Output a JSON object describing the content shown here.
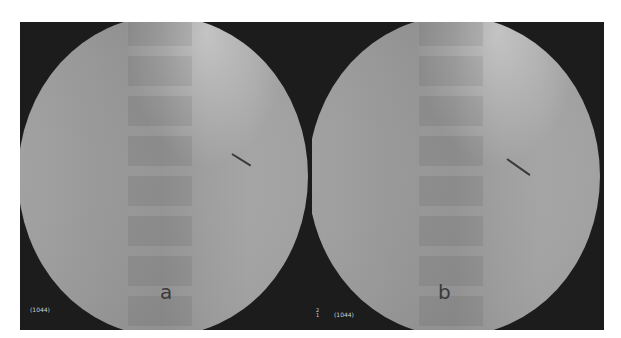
{
  "figure": {
    "panels": [
      {
        "label": "a",
        "code": "(1044)"
      },
      {
        "label": "b",
        "code": "(1044)",
        "marker": "2\n1"
      }
    ]
  }
}
